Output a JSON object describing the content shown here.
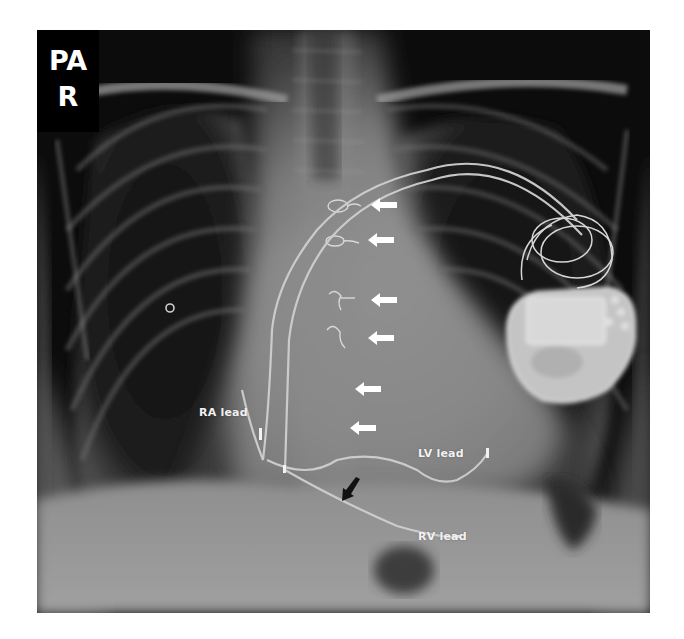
{
  "figure": {
    "type": "chest-radiograph",
    "background": "#ffffff",
    "image_bounds": {
      "x": 37,
      "y": 30,
      "width": 613,
      "height": 583
    }
  },
  "view_badge": {
    "line1": "PA",
    "line2": "R",
    "background": "#000000",
    "text_color": "#ffffff"
  },
  "labels": {
    "ra_lead": {
      "text": "RA lead",
      "x": 199,
      "y": 406
    },
    "lv_lead": {
      "text": "LV lead",
      "x": 418,
      "y": 447
    },
    "rv_lead": {
      "text": "RV lead",
      "x": 418,
      "y": 530
    }
  },
  "white_arrows": {
    "color": "#ffffff",
    "direction": "left",
    "items": [
      {
        "x": 371,
        "y": 205
      },
      {
        "x": 368,
        "y": 240
      },
      {
        "x": 371,
        "y": 300
      },
      {
        "x": 368,
        "y": 338
      },
      {
        "x": 355,
        "y": 389
      },
      {
        "x": 350,
        "y": 428
      }
    ]
  },
  "black_arrow": {
    "color": "#111111",
    "direction": "down-left",
    "x": 343,
    "y": 478
  }
}
